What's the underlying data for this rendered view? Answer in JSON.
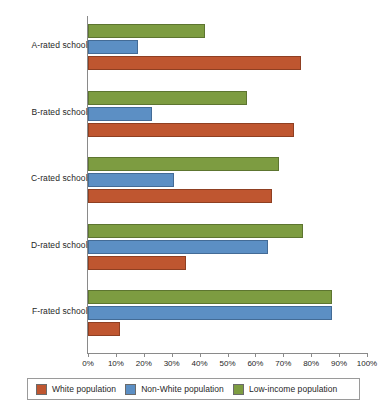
{
  "chart_data": {
    "type": "bar",
    "orientation": "horizontal",
    "title": "",
    "xlabel": "",
    "ylabel": "",
    "xlim": [
      0,
      100
    ],
    "xticks": [
      "0%",
      "10%",
      "20%",
      "30%",
      "40%",
      "50%",
      "60%",
      "70%",
      "80%",
      "90%",
      "100%"
    ],
    "grid": false,
    "legend_position": "bottom",
    "categories": [
      "A-rated schools",
      "B-rated schools",
      "C-rated schools",
      "D-rated schools",
      "F-rated schools"
    ],
    "series": [
      {
        "name": "White population",
        "color": "#bf5630",
        "values": [
          76.5,
          74,
          66,
          35,
          11.5
        ]
      },
      {
        "name": "Non-White population",
        "color": "#5c8fc4",
        "values": [
          18,
          23,
          31,
          64.5,
          87.5
        ]
      },
      {
        "name": "Low-income population",
        "color": "#7d9c41",
        "values": [
          42,
          57,
          68.5,
          77,
          87.5
        ]
      }
    ]
  },
  "legend": {
    "items": [
      {
        "label": "White population",
        "color": "#bf5630"
      },
      {
        "label": "Non-White population",
        "color": "#5c8fc4"
      },
      {
        "label": "Low-income population",
        "color": "#7d9c41"
      }
    ]
  }
}
